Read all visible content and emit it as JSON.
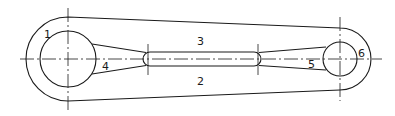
{
  "diagram": {
    "type": "mechanical-drawing",
    "stroke_color": "#1a1a1a",
    "background": "#ffffff",
    "labels": [
      {
        "id": "1",
        "text": "1",
        "x": 44,
        "y": 38
      },
      {
        "id": "2",
        "text": "2",
        "x": 197,
        "y": 85
      },
      {
        "id": "3",
        "text": "3",
        "x": 197,
        "y": 45
      },
      {
        "id": "4",
        "text": "4",
        "x": 102,
        "y": 70
      },
      {
        "id": "5",
        "text": "5",
        "x": 308,
        "y": 68
      },
      {
        "id": "6",
        "text": "6",
        "x": 358,
        "y": 57
      }
    ]
  }
}
